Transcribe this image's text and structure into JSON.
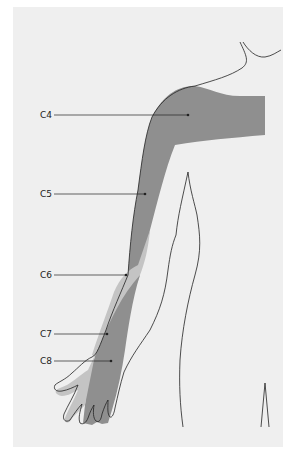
{
  "diagram": {
    "labels": [
      {
        "id": "c4",
        "text": "C4"
      },
      {
        "id": "c5",
        "text": "C5"
      },
      {
        "id": "c6",
        "text": "C6"
      },
      {
        "id": "c7",
        "text": "C7"
      },
      {
        "id": "c8",
        "text": "C8"
      }
    ],
    "colors": {
      "background": "#efefef",
      "dark_region": "#8f8f8f",
      "light_region": "#c4c4c4",
      "outline": "#222222"
    }
  }
}
